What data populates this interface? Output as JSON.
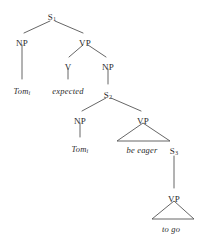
{
  "figure": {
    "kind": "syntactic-tree-diagram",
    "sentence": "Tom expected Tom be eager to go",
    "stroke_color": "#555555",
    "text_color": "#2b2b2b",
    "background": "#ffffff"
  },
  "nodes": {
    "s1": {
      "label": "S",
      "subscript": "1",
      "x": 52,
      "y": 13
    },
    "np1": {
      "label": "NP",
      "subscript": "",
      "x": 22,
      "y": 39
    },
    "tom1": {
      "label": "Tom",
      "subscript": "i",
      "x": 22,
      "y": 87
    },
    "vp1": {
      "label": "VP",
      "subscript": "",
      "x": 85,
      "y": 39
    },
    "v1": {
      "label": "V",
      "subscript": "",
      "x": 68,
      "y": 63
    },
    "expected": {
      "label": "expected",
      "subscript": "",
      "x": 68,
      "y": 87
    },
    "np2": {
      "label": "NP",
      "subscript": "",
      "x": 108,
      "y": 63
    },
    "s2": {
      "label": "S",
      "subscript": "2",
      "x": 108,
      "y": 91
    },
    "np3": {
      "label": "NP",
      "subscript": "",
      "x": 80,
      "y": 117
    },
    "tom2": {
      "label": "Tom",
      "subscript": "i",
      "x": 80,
      "y": 145
    },
    "vp2": {
      "label": "VP",
      "subscript": "",
      "x": 143,
      "y": 117
    },
    "beeager": {
      "label": "be eager",
      "subscript": "",
      "x": 142,
      "y": 146
    },
    "s3": {
      "label": "S",
      "subscript": "3",
      "x": 174,
      "y": 147
    },
    "vp3": {
      "label": "VP",
      "subscript": "",
      "x": 174,
      "y": 195
    },
    "togo": {
      "label": "to go",
      "subscript": "",
      "x": 171,
      "y": 225
    }
  },
  "edges": [
    {
      "name": "s1-to-np1",
      "x1": 50,
      "y1": 21,
      "x2": 24,
      "y2": 33
    },
    {
      "name": "s1-to-vp1",
      "x1": 55,
      "y1": 21,
      "x2": 83,
      "y2": 33
    },
    {
      "name": "np1-to-tom1",
      "x1": 22,
      "y1": 45,
      "x2": 22,
      "y2": 79
    },
    {
      "name": "vp1-to-v1",
      "x1": 83,
      "y1": 45,
      "x2": 69,
      "y2": 57
    },
    {
      "name": "vp1-to-np2",
      "x1": 88,
      "y1": 45,
      "x2": 106,
      "y2": 57
    },
    {
      "name": "v1-to-expected",
      "x1": 68,
      "y1": 69,
      "x2": 68,
      "y2": 79
    },
    {
      "name": "np2-to-s2",
      "x1": 108,
      "y1": 69,
      "x2": 108,
      "y2": 84
    },
    {
      "name": "s2-to-np3",
      "x1": 106,
      "y1": 98,
      "x2": 82,
      "y2": 111
    },
    {
      "name": "s2-to-vp2",
      "x1": 111,
      "y1": 98,
      "x2": 141,
      "y2": 111
    },
    {
      "name": "np3-to-tom2",
      "x1": 80,
      "y1": 123,
      "x2": 80,
      "y2": 137
    },
    {
      "name": "s3-to-vp3",
      "x1": 174,
      "y1": 156,
      "x2": 174,
      "y2": 188
    }
  ],
  "triangles": [
    {
      "name": "vp2-triangle-be-eager",
      "apex_x": 143,
      "apex_y": 123,
      "left_x": 117,
      "left_y": 141,
      "right_x": 170,
      "right_y": 141
    },
    {
      "name": "vp3-triangle-to-go",
      "apex_x": 174,
      "apex_y": 201,
      "left_x": 152,
      "left_y": 219,
      "right_x": 194,
      "right_y": 219
    }
  ]
}
